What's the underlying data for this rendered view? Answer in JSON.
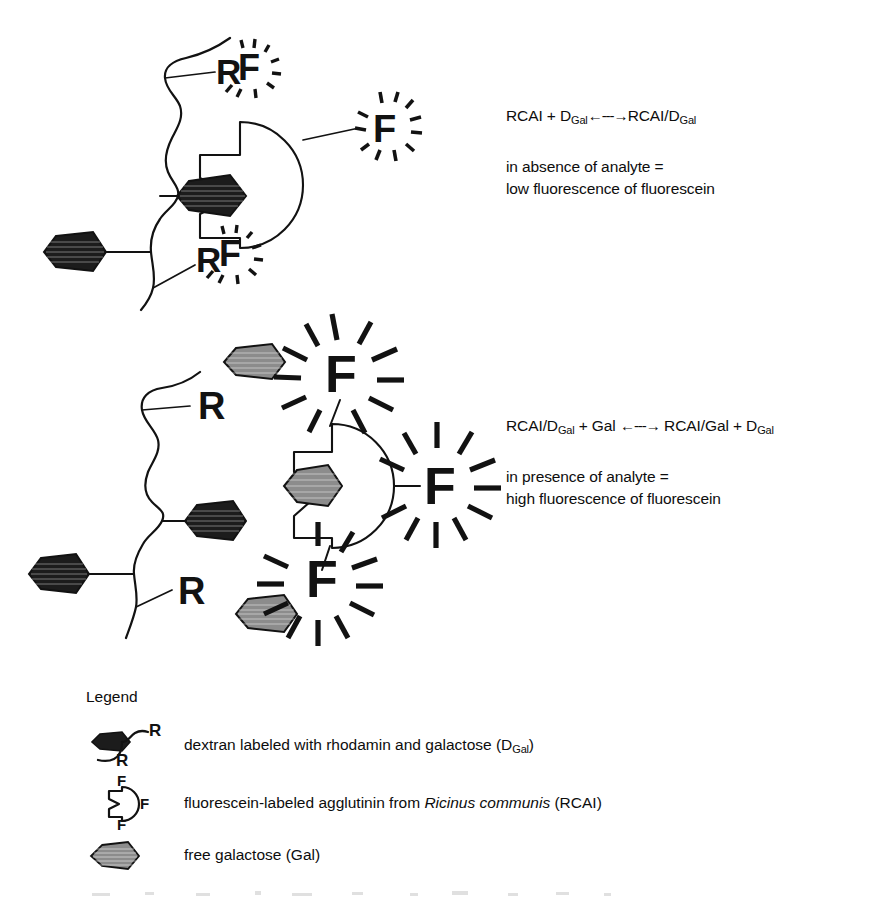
{
  "figure": {
    "ink_color": "#121212",
    "background_color": "#ffffff",
    "rhodamine_dextran_fill": "#1c1c1c",
    "free_galactose_fill": "#8c8c8c"
  },
  "panel_top": {
    "caption_formula_prefix": "RCAI + D",
    "caption_formula_sub1": "Gal",
    "caption_formula_arrow": "←---→",
    "caption_formula_suffix": "RCAI/D",
    "caption_formula_sub2": "Gal",
    "description_line1": "in absence of analyte =",
    "description_line2": "low fluorescence of fluorescein",
    "label_r": "R",
    "label_f": "F"
  },
  "panel_bottom": {
    "caption_formula_prefix": "RCAI/D",
    "caption_formula_sub1": "Gal",
    "caption_formula_mid": " + Gal ",
    "caption_formula_arrow": "←---→",
    "caption_formula_suffix": " RCAI/Gal + D",
    "caption_formula_sub2": "Gal",
    "description_line1": "in presence of analyte =",
    "description_line2": "high fluorescence of fluorescein",
    "label_r": "R",
    "label_f": "F"
  },
  "legend": {
    "title": "Legend",
    "items": [
      {
        "icon": "rhodamine-dextran-icon",
        "text_before": "dextran labeled with rhodamin and galactose (D",
        "text_sub": "Gal",
        "text_after": ")",
        "glyph_r_top": "R",
        "glyph_r_bottom": "R"
      },
      {
        "icon": "fluorescein-agglutinin-icon",
        "text_before": "fluorescein-labeled agglutinin from ",
        "text_italic": "Ricinus communis",
        "text_after": " (RCAI)",
        "glyph_f_top": "F",
        "glyph_f_right": "F",
        "glyph_f_bottom": "F"
      },
      {
        "icon": "free-galactose-icon",
        "text_before": "free galactose (Gal)",
        "text_sub": "",
        "text_after": ""
      }
    ]
  }
}
